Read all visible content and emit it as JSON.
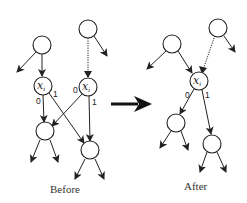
{
  "diagram": {
    "type": "decision-diagram-node-merge",
    "before": {
      "caption": "Before",
      "nodes": [
        {
          "id": "top-left",
          "label": ""
        },
        {
          "id": "top-right",
          "label": ""
        },
        {
          "id": "xi-left",
          "label": "x",
          "subscript": "i"
        },
        {
          "id": "xi-right",
          "label": "x",
          "subscript": "i"
        },
        {
          "id": "low-left",
          "label": ""
        },
        {
          "id": "low-right",
          "label": ""
        }
      ],
      "edge_labels": {
        "xi_left_0": "0",
        "xi_left_1": "1",
        "xi_right_0": "0",
        "xi_right_1": "1"
      }
    },
    "transition_arrow": "right-arrow",
    "after": {
      "caption": "After",
      "nodes": [
        {
          "id": "top-left",
          "label": ""
        },
        {
          "id": "top-right",
          "label": ""
        },
        {
          "id": "xi-merged",
          "label": "x",
          "subscript": "i"
        },
        {
          "id": "low-left",
          "label": ""
        },
        {
          "id": "low-right",
          "label": ""
        }
      ],
      "edge_labels": {
        "xi_0": "0",
        "xi_1": "1"
      }
    },
    "colors": {
      "stroke": "#222222",
      "background": "#ffffff"
    }
  }
}
